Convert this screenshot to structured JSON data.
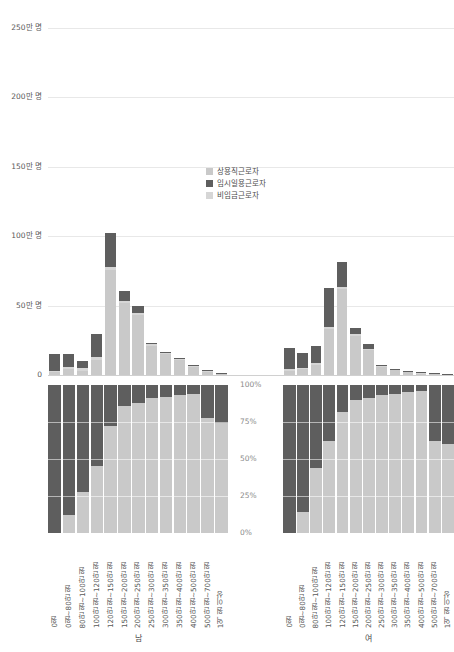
{
  "chart_data": {
    "type": "bar",
    "title": "",
    "subtitle": "",
    "xlabel": "",
    "ylabel": "",
    "grid": true,
    "legend_position": "center",
    "categories": [
      "0원",
      "0원~80만 원",
      "80만 원~100만 원",
      "100만 원~120만 원",
      "120만 원~150만 원",
      "150만 원~200만 원",
      "200만 원~250만 원",
      "250만 원~300만 원",
      "300만 원~350만 원",
      "350만 원~400만 원",
      "400만 원~500만 원",
      "500만 원~700만 원",
      "1억 원 이상"
    ],
    "legend": [
      {
        "name": "상용직근로자",
        "color": "#c9c9c9"
      },
      {
        "name": "임시일용근로자",
        "color": "#5e5e5e"
      },
      {
        "name": "비임금근로자",
        "color": "#d6d6d6"
      }
    ],
    "count_axis": {
      "ticks": [
        "0",
        "50만 명",
        "100만 명",
        "150만 명",
        "200만 명",
        "250만 명"
      ],
      "values": [
        0,
        500000,
        1000000,
        1500000,
        2000000,
        2500000
      ],
      "ylim": [
        0,
        2500000
      ]
    },
    "percent_axis": {
      "ticks": [
        "0%",
        "25%",
        "50%",
        "75%",
        "100%"
      ],
      "values": [
        0,
        25,
        50,
        75,
        100
      ],
      "ylim": [
        0,
        100
      ]
    },
    "facets": [
      {
        "label": "남",
        "counts": {
          "상용직근로자": [
            20000,
            40000,
            30000,
            110000,
            760000,
            520000,
            430000,
            210000,
            150000,
            110000,
            60000,
            20000,
            6000
          ],
          "임시일용근로자": [
            125000,
            95000,
            50000,
            160000,
            240000,
            70000,
            55000,
            10000,
            8000,
            6000,
            4000,
            3000,
            1000
          ],
          "비임금근로자": [
            10000,
            15000,
            18000,
            22000,
            20000,
            16000,
            14000,
            10000,
            8000,
            7000,
            6000,
            12000,
            10000
          ]
        },
        "percent": {
          "상용직근로자": [
            0,
            12,
            28,
            45,
            72,
            86,
            88,
            91,
            92,
            93,
            94,
            78,
            74
          ],
          "임시일용근로자": [
            100,
            88,
            72,
            55,
            28,
            14,
            12,
            9,
            8,
            7,
            6,
            22,
            26
          ],
          "비임금근로자": [
            0,
            0,
            0,
            0,
            0,
            0,
            0,
            0,
            0,
            0,
            0,
            0,
            0
          ]
        }
      },
      {
        "label": "여",
        "counts": {
          "상용직근로자": [
            30000,
            40000,
            70000,
            330000,
            620000,
            280000,
            180000,
            60000,
            35000,
            22000,
            14000,
            8000,
            3000
          ],
          "임시일용근로자": [
            155000,
            105000,
            125000,
            280000,
            180000,
            45000,
            30000,
            8000,
            5000,
            4000,
            3000,
            2000,
            1000
          ],
          "비임금근로자": [
            12000,
            14000,
            16000,
            18000,
            16000,
            12000,
            10000,
            7000,
            5000,
            4000,
            3000,
            4000,
            3000
          ]
        },
        "percent": {
          "상용직근로자": [
            0,
            14,
            44,
            62,
            82,
            90,
            91,
            93,
            94,
            95,
            96,
            62,
            60
          ],
          "임시일용근로자": [
            100,
            86,
            56,
            38,
            18,
            10,
            9,
            7,
            6,
            5,
            4,
            38,
            40
          ],
          "비임금근로자": [
            0,
            0,
            0,
            0,
            0,
            0,
            0,
            0,
            0,
            0,
            0,
            0,
            0
          ]
        }
      }
    ]
  }
}
